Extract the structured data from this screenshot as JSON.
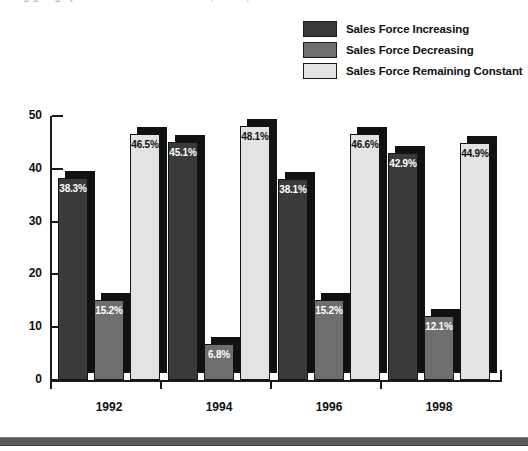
{
  "page": {
    "clipped_top_text": "ing going up . . . . . . . . . . . . . . . . . . . . . .  ,          .        .        .        .         .  ,"
  },
  "legend": {
    "position": "top-right",
    "items": [
      {
        "label": "Sales Force Increasing",
        "color": "#3a3a3a",
        "swatch_name": "legend-swatch-increasing"
      },
      {
        "label": "Sales Force Decreasing",
        "color": "#6e6e6e",
        "swatch_name": "legend-swatch-decreasing"
      },
      {
        "label": "Sales Force Remaining Constant",
        "color": "#e3e3e3",
        "swatch_name": "legend-swatch-constant"
      }
    ]
  },
  "axes": {
    "y_ticks": [
      "50",
      "40",
      "30",
      "20",
      "10",
      "0"
    ],
    "x_ticks": [
      "1992",
      "1994",
      "1996",
      "1998"
    ]
  },
  "chart_data": {
    "type": "bar",
    "title": "",
    "subtitle": "",
    "xlabel": "",
    "ylabel": "",
    "ylim": [
      0,
      50
    ],
    "grid": false,
    "legend_position": "top-right",
    "categories": [
      "1992",
      "1994",
      "1996",
      "1998"
    ],
    "series": [
      {
        "name": "Sales Force Increasing",
        "color": "#3a3a3a",
        "label_color": "#ffffff",
        "values": [
          38.3,
          45.1,
          38.1,
          42.9
        ],
        "data_labels": [
          "38.3%",
          "45.1%",
          "38.1%",
          "42.9%"
        ]
      },
      {
        "name": "Sales Force Decreasing",
        "color": "#6e6e6e",
        "label_color": "#ffffff",
        "values": [
          15.2,
          6.8,
          15.2,
          12.1
        ],
        "data_labels": [
          "15.2%",
          "6.8%",
          "15.2%",
          "12.1%"
        ]
      },
      {
        "name": "Sales Force Remaining Constant",
        "color": "#e3e3e3",
        "label_color": "#111111",
        "values": [
          46.5,
          48.1,
          46.6,
          44.9
        ],
        "data_labels": [
          "46.5%",
          "48.1%",
          "46.6%",
          "44.9%"
        ]
      }
    ]
  },
  "style": {
    "shadow_color": "#111111",
    "axis_color": "#1a1a1a",
    "bottom_band_color": "#5a5a5c",
    "background": "#ffffff"
  }
}
